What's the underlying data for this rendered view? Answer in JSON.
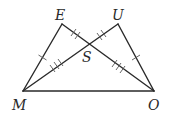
{
  "diagram": {
    "type": "geometry",
    "colors": {
      "line": "#2a2a2a",
      "tick": "#555555",
      "background": "#ffffff"
    },
    "points": [
      {
        "id": "E",
        "label": "E",
        "x": 62,
        "y": 24,
        "label_x": 55,
        "label_y": 20
      },
      {
        "id": "U",
        "label": "U",
        "x": 118,
        "y": 24,
        "label_x": 113,
        "label_y": 20
      },
      {
        "id": "M",
        "label": "M",
        "x": 23,
        "y": 91,
        "label_x": 12,
        "label_y": 110
      },
      {
        "id": "O",
        "label": "O",
        "x": 154,
        "y": 91,
        "label_x": 148,
        "label_y": 110
      },
      {
        "id": "S",
        "label": "S",
        "x": 89,
        "y": 44,
        "label_x": 82,
        "label_y": 62
      }
    ],
    "segments": [
      {
        "from": "E",
        "to": "M",
        "ticks": 1
      },
      {
        "from": "U",
        "to": "O",
        "ticks": 1
      },
      {
        "from": "E",
        "to": "S",
        "ticks": 2
      },
      {
        "from": "U",
        "to": "S",
        "ticks": 2
      },
      {
        "from": "M",
        "to": "S",
        "ticks": 3
      },
      {
        "from": "O",
        "to": "S",
        "ticks": 3
      },
      {
        "from": "M",
        "to": "O",
        "ticks": 0
      }
    ]
  }
}
